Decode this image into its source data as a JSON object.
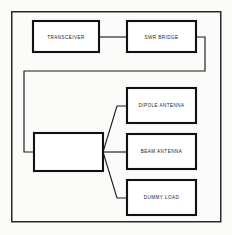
{
  "diagram": {
    "background_color": "#fbfbf9",
    "line_color": "#1c1c1c",
    "box_fill": "#ffffff",
    "frame": {
      "x": 11,
      "y": 11,
      "width": 210,
      "height": 211
    },
    "blocks": [
      {
        "id": "transceiver",
        "label": "TRANSCEIVER",
        "x": 33,
        "y": 21,
        "width": 66,
        "height": 31
      },
      {
        "id": "swr-bridge",
        "label": "SWR BRIDGE",
        "x": 127,
        "y": 21,
        "width": 69,
        "height": 31
      },
      {
        "id": "antenna-switch",
        "label": "",
        "x": 34,
        "y": 133,
        "width": 69,
        "height": 38
      },
      {
        "id": "dipole-antenna",
        "label": "DIPOLE ANTENNA",
        "x": 127,
        "y": 88,
        "width": 69,
        "height": 35
      },
      {
        "id": "beam-antenna",
        "label": "BEAM ANTENNA",
        "x": 127,
        "y": 134,
        "width": 69,
        "height": 35
      },
      {
        "id": "dummy-load",
        "label": "DUMMY LOAD",
        "x": 127,
        "y": 180,
        "width": 69,
        "height": 35
      }
    ],
    "connections": [
      {
        "id": "transceiver-to-swr",
        "from": "transceiver",
        "to": "swr-bridge",
        "path": "M 99 37 L 127 37"
      },
      {
        "id": "swr-to-switch",
        "from": "swr-bridge",
        "to": "antenna-switch",
        "path": "M 196 37 L 205 37 L 205 71 L 24 71 L 24 152 L 34 152"
      },
      {
        "id": "switch-to-dipole",
        "from": "antenna-switch",
        "to": "dipole-antenna",
        "path": "M 103 152 L 117 106 L 127 106"
      },
      {
        "id": "switch-to-beam",
        "from": "antenna-switch",
        "to": "beam-antenna",
        "path": "M 103 152 L 127 152"
      },
      {
        "id": "switch-to-dummy-load",
        "from": "antenna-switch",
        "to": "dummy-load",
        "path": "M 103 152 L 117 198 L 127 198"
      }
    ]
  }
}
